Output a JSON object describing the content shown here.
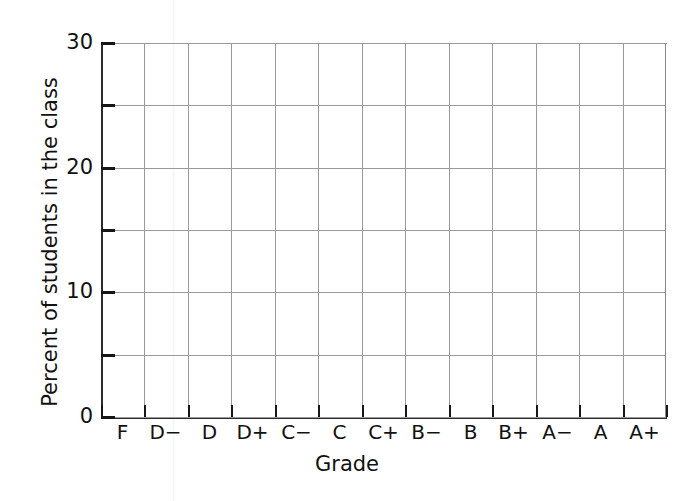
{
  "chart_data": {
    "type": "bar",
    "title": "",
    "subtitle": "",
    "xlabel": "Grade",
    "ylabel": "Percent of students in the class",
    "categories": [
      "F",
      "D−",
      "D",
      "D+",
      "C−",
      "C",
      "C+",
      "B−",
      "B",
      "B+",
      "A−",
      "A",
      "A+"
    ],
    "values": [
      null,
      null,
      null,
      null,
      null,
      null,
      null,
      null,
      null,
      null,
      null,
      null,
      null
    ],
    "series": [
      {
        "name": "Percent of students in the class",
        "values": [
          null,
          null,
          null,
          null,
          null,
          null,
          null,
          null,
          null,
          null,
          null,
          null,
          null
        ]
      }
    ],
    "ylim": [
      0,
      30
    ],
    "y_major_ticks": [
      0,
      10,
      20,
      30
    ],
    "y_gridlines": [
      0,
      5,
      10,
      15,
      20,
      25,
      30
    ],
    "y_tick_labels": [
      "0",
      "10",
      "20",
      "30"
    ],
    "grid": true,
    "grid_orientation": "both",
    "legend": false,
    "legend_position": "none",
    "note": "Blank grid template — no bars are plotted",
    "colors": {
      "grid": "#9a9a9a",
      "axis": "#2b2b2b",
      "text": "#111111",
      "background": "#ffffff"
    }
  },
  "axes": {
    "y_title": "Percent of students in the class",
    "x_title": "Grade"
  }
}
